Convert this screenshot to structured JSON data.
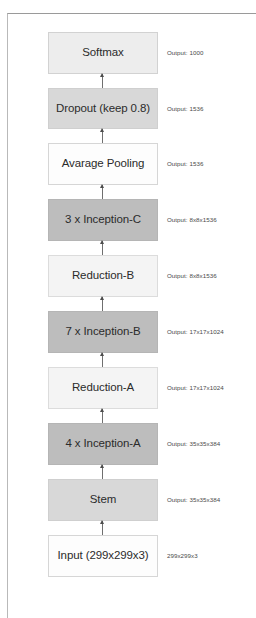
{
  "diagram": {
    "orientation": "bottom-to-top",
    "colors": {
      "dark_block": "#bdbdbd",
      "medium_block": "#d8d8d8",
      "light_block": "#ededed",
      "lighter_block": "#f4f4f4",
      "white_block": "#fdfdfd",
      "border": "#c9c9c9",
      "arrow": "#6f6f6f",
      "text": "#2b2b2b",
      "annotation_text": "#4a4a4a"
    },
    "nodes": [
      {
        "id": "softmax",
        "label": "Softmax",
        "annotation": "Output: 1000",
        "shade": "light"
      },
      {
        "id": "dropout",
        "label": "Dropout (keep 0.8)",
        "annotation": "Output: 1536",
        "shade": "medium"
      },
      {
        "id": "avg-pooling",
        "label": "Avarage Pooling",
        "annotation": "Output: 1536",
        "shade": "white"
      },
      {
        "id": "inception-c",
        "label": "3 x Inception-C",
        "annotation": "Output: 8x8x1536",
        "shade": "dark"
      },
      {
        "id": "reduction-b",
        "label": "Reduction-B",
        "annotation": "Output: 8x8x1536",
        "shade": "lighter"
      },
      {
        "id": "inception-b",
        "label": "7 x Inception-B",
        "annotation": "Output: 17x17x1024",
        "shade": "dark"
      },
      {
        "id": "reduction-a",
        "label": "Reduction-A",
        "annotation": "Output: 17x17x1024",
        "shade": "lighter"
      },
      {
        "id": "inception-a",
        "label": "4 x Inception-A",
        "annotation": "Output: 35x35x384",
        "shade": "dark"
      },
      {
        "id": "stem",
        "label": "Stem",
        "annotation": "Output: 35x35x384",
        "shade": "medium"
      },
      {
        "id": "input",
        "label": "Input (299x299x3)",
        "annotation": "299x299x3",
        "shade": "white"
      }
    ],
    "connectors": [
      {
        "id": "arrow-input-to-stem",
        "from": "input",
        "to": "stem",
        "direction": "up"
      },
      {
        "id": "arrow-stem-to-inception-a",
        "from": "stem",
        "to": "inception-a",
        "direction": "up"
      },
      {
        "id": "arrow-inception-a-to-reduction-a",
        "from": "inception-a",
        "to": "reduction-a",
        "direction": "up"
      },
      {
        "id": "arrow-reduction-a-to-inception-b",
        "from": "reduction-a",
        "to": "inception-b",
        "direction": "up"
      },
      {
        "id": "arrow-inception-b-to-reduction-b",
        "from": "inception-b",
        "to": "reduction-b",
        "direction": "up"
      },
      {
        "id": "arrow-reduction-b-to-inception-c",
        "from": "reduction-b",
        "to": "inception-c",
        "direction": "up"
      },
      {
        "id": "arrow-inception-c-to-avg-pooling",
        "from": "inception-c",
        "to": "avg-pooling",
        "direction": "up"
      },
      {
        "id": "arrow-avg-pooling-to-dropout",
        "from": "avg-pooling",
        "to": "dropout",
        "direction": "up"
      },
      {
        "id": "arrow-dropout-to-softmax",
        "from": "dropout",
        "to": "softmax",
        "direction": "up"
      }
    ]
  }
}
